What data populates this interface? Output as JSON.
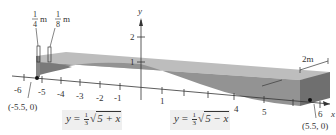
{
  "figure": {
    "type": "3d-beam-diagram",
    "axes": {
      "x_label": "x",
      "y_label": "y",
      "x_ticks": [
        "-6",
        "-5",
        "-4",
        "-3",
        "-2",
        "-1",
        "1",
        "4",
        "5",
        "6"
      ],
      "y_ticks": [
        "1",
        "2"
      ]
    },
    "points": [
      {
        "label": "(-5.5, 0)"
      },
      {
        "label": "(5.5, 0)"
      }
    ],
    "dimensions": {
      "quarter": {
        "num": "1",
        "den": "4",
        "unit": "m"
      },
      "eighth": {
        "num": "1",
        "den": "8",
        "unit": "m"
      },
      "width": "2m"
    },
    "formulas": {
      "left": {
        "lhs": "y",
        "eq": "=",
        "num": "1",
        "den": "3",
        "radicand": "5 + x"
      },
      "right": {
        "lhs": "y",
        "eq": "=",
        "num": "1",
        "den": "3",
        "radicand": "5 − x"
      }
    },
    "colors": {
      "beam_top": "#b9b9b9",
      "beam_front": "#8f8f8f",
      "beam_end": "#6e6e6e",
      "axis": "#333333",
      "formula_bg": "#efefef"
    }
  }
}
